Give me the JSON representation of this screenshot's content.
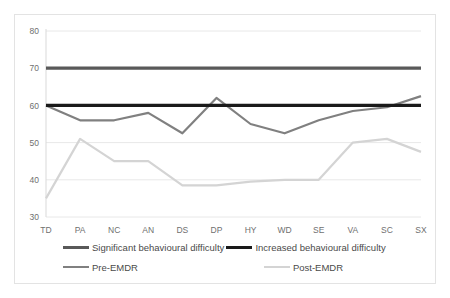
{
  "chart_data": {
    "type": "line",
    "title": "",
    "xlabel": "",
    "ylabel": "",
    "categories": [
      "TD",
      "PA",
      "NC",
      "AN",
      "DS",
      "DP",
      "HY",
      "WD",
      "SE",
      "VA",
      "SC",
      "SX"
    ],
    "ylim": [
      30,
      80
    ],
    "yticks": [
      30,
      40,
      50,
      60,
      70,
      80
    ],
    "grid": true,
    "legend_position": "bottom",
    "series": [
      {
        "name": "Significant behavioural difficulty",
        "color": "#595959",
        "width": 3.2,
        "values": [
          70,
          70,
          70,
          70,
          70,
          70,
          70,
          70,
          70,
          70,
          70,
          70
        ]
      },
      {
        "name": "Increased behavioural difficulty",
        "color": "#1a1a1a",
        "width": 3.2,
        "values": [
          60,
          60,
          60,
          60,
          60,
          60,
          60,
          60,
          60,
          60,
          60,
          60
        ]
      },
      {
        "name": "Pre-EMDR",
        "color": "#808080",
        "width": 2.2,
        "values": [
          60,
          56,
          56,
          58,
          52.5,
          62,
          55,
          52.5,
          56,
          58.5,
          59.5,
          62.5
        ]
      },
      {
        "name": "Post-EMDR",
        "color": "#d4d4d4",
        "width": 2.2,
        "values": [
          35,
          51,
          45,
          45,
          38.5,
          38.5,
          39.5,
          40,
          40,
          50,
          51,
          47.5
        ]
      }
    ]
  },
  "legend": {
    "entries": [
      {
        "label": "Significant behavioural difficulty",
        "color": "#595959",
        "width": 3.2
      },
      {
        "label": "Increased behavioural difficulty",
        "color": "#1a1a1a",
        "width": 3.2
      },
      {
        "label": "Pre-EMDR",
        "color": "#808080",
        "width": 2.2
      },
      {
        "label": "Post-EMDR",
        "color": "#d4d4d4",
        "width": 2.2
      }
    ]
  }
}
